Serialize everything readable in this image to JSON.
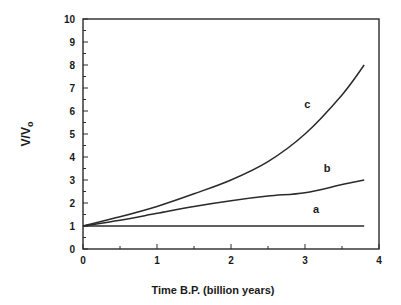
{
  "chart_data": {
    "type": "line",
    "title": "",
    "xlabel": "Time B.P. (billion years)",
    "ylabel": "V/V",
    "ylabel_subscript": "o",
    "xlim": [
      0,
      4
    ],
    "ylim": [
      0,
      10
    ],
    "x_ticks": [
      0,
      1,
      2,
      3,
      4
    ],
    "y_ticks": [
      0,
      1,
      2,
      3,
      4,
      5,
      6,
      7,
      8,
      9,
      10
    ],
    "minor_ticks": true,
    "grid": false,
    "legend": "inline curve labels",
    "series": [
      {
        "name": "a",
        "x": [
          0,
          0.5,
          1,
          1.5,
          2,
          2.5,
          3,
          3.5,
          3.8
        ],
        "values": [
          1,
          1,
          1,
          1,
          1,
          1,
          1,
          1,
          1
        ],
        "label_pos": [
          3.15,
          1.55
        ]
      },
      {
        "name": "b",
        "x": [
          0,
          0.5,
          1,
          1.5,
          2,
          2.5,
          3,
          3.5,
          3.8
        ],
        "values": [
          1,
          1.25,
          1.55,
          1.85,
          2.1,
          2.3,
          2.45,
          2.8,
          3.0
        ],
        "label_pos": [
          3.3,
          3.35
        ]
      },
      {
        "name": "c",
        "x": [
          0,
          0.5,
          1,
          1.5,
          2,
          2.5,
          3,
          3.5,
          3.8
        ],
        "values": [
          1,
          1.4,
          1.85,
          2.4,
          3.0,
          3.8,
          5.0,
          6.7,
          8.0
        ],
        "label_pos": [
          3.03,
          6.15
        ]
      }
    ]
  }
}
